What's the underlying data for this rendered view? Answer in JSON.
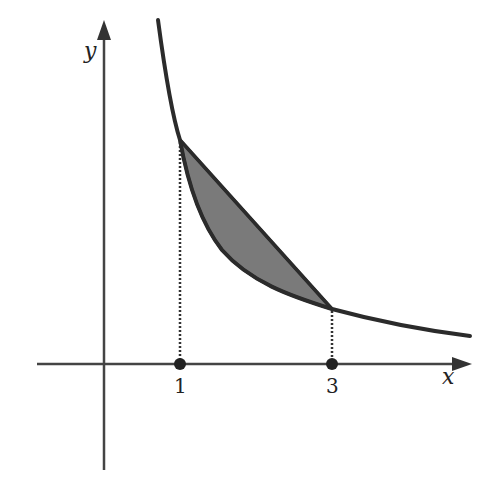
{
  "figure": {
    "type": "area between curve and secant",
    "axes": {
      "x_label": "x",
      "y_label": "y"
    },
    "ticks": [
      {
        "value": 1,
        "label": "1"
      },
      {
        "value": 3,
        "label": "3"
      }
    ],
    "curve": "decreasing convex curve y = f(x)",
    "secant": {
      "from_x": 1,
      "to_x": 3
    },
    "shaded_region": "between secant line and curve on [1, 3]",
    "colors": {
      "line": "#2b2b2b",
      "fill": "#7a7a7a",
      "background": "#ffffff"
    }
  }
}
